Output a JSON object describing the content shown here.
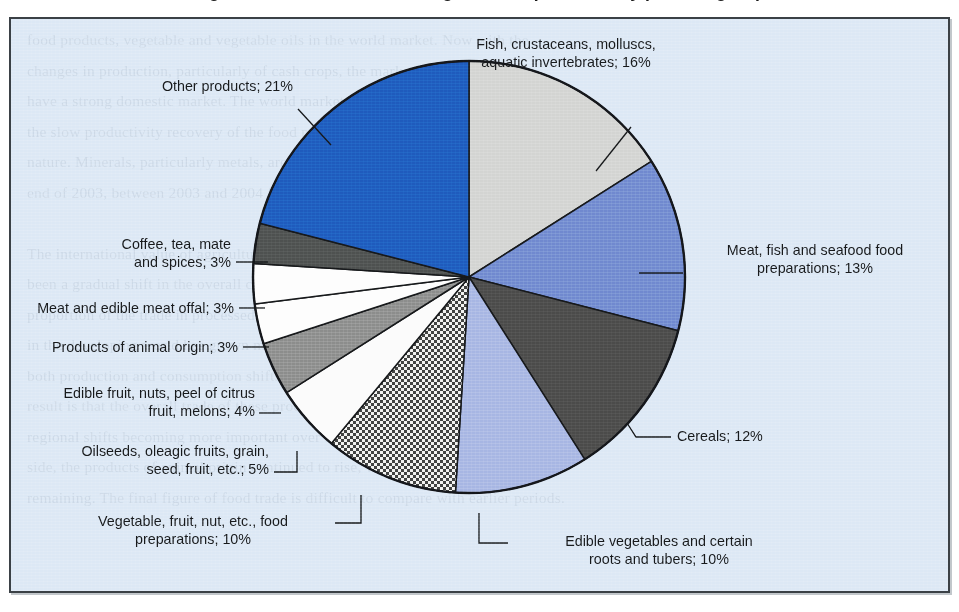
{
  "title": "Figure: Structure of trade in agricultural products, by product group",
  "panel": {
    "background_color": "#dce8f5",
    "border_color": "#3b4146"
  },
  "bleed_text": "food products, vegetable and vegetable oils in the world market. Now with the\nchanges in production, particularly of cash crops, the market has risen sharply\nhave a strong domestic market. The world market has continued to decline, while\nthe slow productivity recovery of the food processing industry has been of a gradual\nnature. Minerals, particularly metals, are important in the overall industry as of the\nend of 2003, between 2003 and 2004 for the world market in agricultural products.\n\nThe international value of agricultural exports has continued to grow, and there has\nbeen a gradual shift in the overall composition of trade in recent years, with the\nproportion of the trade in processed food products increasing. The value of trade\nin the developing world has grown more quickly than the world average, reflecting\nboth production and consumption shifts in a number of developing economies. The\nresult is that the overall trade of these products has remained broadly stable, with\nregional shifts becoming more important over the medium term. On the commodity\nside, the products of animal origin continued to rise, with demand for cereals\nremaining. The final figure of food trade is difficult to compare with earlier periods.",
  "chart_data": {
    "type": "pie",
    "title": "Structure of trade in agricultural products, by product group",
    "unit": "%",
    "start_angle_deg": 0,
    "direction": "clockwise",
    "legend": "callout-labels",
    "categories": [
      "Fish, crustaceans, molluscs, aquatic invertebrates",
      "Meat, fish and seafood food preparations",
      "Cereals",
      "Edible vegetables and certain roots and tubers",
      "Vegetable, fruit, nut, etc., food preparations",
      "Oilseeds, oleagic fruits, grain, seed, fruit, etc.",
      "Edible fruit, nuts, peel of citrus fruit, melons",
      "Products of animal origin",
      "Meat and edible meat offal",
      "Coffee, tea, mate and spices",
      "Other products"
    ],
    "values": [
      16,
      13,
      12,
      10,
      10,
      5,
      4,
      3,
      3,
      3,
      21
    ],
    "colors": [
      "#d3d4d2",
      "#7089cf",
      "#4b4b4a",
      "#a7b6e3",
      "#ffffff",
      "#fbfbfb",
      "#8c8d8c",
      "#fdfdfd",
      "#fdfdfd",
      "#4e5150",
      "#1f5bbd"
    ],
    "patterns": [
      "solid",
      "solid",
      "solid",
      "solid",
      "checkered",
      "solid",
      "solid",
      "solid",
      "solid",
      "solid",
      "solid"
    ]
  },
  "callouts": {
    "fish": "Fish, crustaceans, molluscs,\naquatic invertebrates; 16%",
    "meat_seafood_prep": "Meat, fish and seafood food\npreparations; 13%",
    "cereals": "Cereals; 12%",
    "edible_vegetables": "Edible vegetables and certain\nroots and tubers; 10%",
    "veg_fruit_nut_prep": "Vegetable, fruit, nut, etc., food\npreparations; 10%",
    "oilseeds": "Oilseeds, oleagic fruits, grain,\nseed, fruit, etc.; 5%",
    "edible_fruit": "Edible fruit, nuts, peel of citrus\nfruit, melons; 4%",
    "animal_origin": "Products of animal origin; 3%",
    "meat_offal": "Meat and edible meat offal; 3%",
    "coffee_tea": "Coffee, tea, mate\nand spices; 3%",
    "other": "Other products; 21%"
  }
}
